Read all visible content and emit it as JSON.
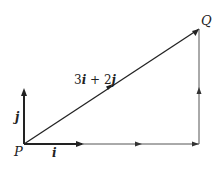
{
  "diagram": {
    "colors": {
      "stroke": "#222222",
      "thin": "#555555",
      "background": "#ffffff"
    },
    "points": {
      "P": {
        "label": "P",
        "x": 24,
        "y": 144
      },
      "Q": {
        "label": "Q",
        "x": 199,
        "y": 29
      }
    },
    "vectors": {
      "i": {
        "label": "i"
      },
      "j": {
        "label": "j"
      },
      "resultant": {
        "label": "3i + 2j"
      }
    },
    "labels": {
      "P": "P",
      "Q": "Q",
      "i": "i",
      "j": "j",
      "resultant_3": "3",
      "resultant_i": "i",
      "resultant_plus": " + 2",
      "resultant_j": "j"
    }
  }
}
